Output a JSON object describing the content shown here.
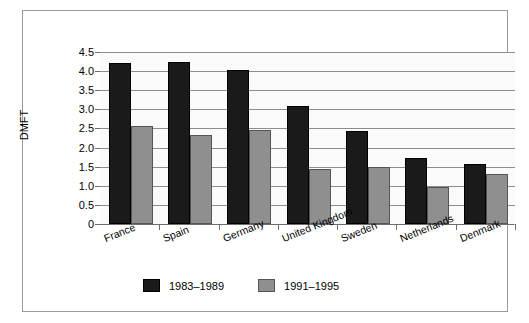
{
  "chart_data": {
    "type": "bar",
    "title": "",
    "xlabel": "",
    "ylabel": "DMFT",
    "ylim": [
      0,
      4.5
    ],
    "yticks": [
      "0",
      "0.5",
      "1.0",
      "1.5",
      "2.0",
      "2.5",
      "3.0",
      "3.5",
      "4.0",
      "4.5"
    ],
    "ytick_values": [
      0,
      0.5,
      1.0,
      1.5,
      2.0,
      2.5,
      3.0,
      3.5,
      4.0,
      4.5
    ],
    "grid": true,
    "legend_position": "bottom",
    "categories": [
      "France",
      "Spain",
      "Germany",
      "United Kingdom",
      "Sweden",
      "Netherlands",
      "Denmark"
    ],
    "series": [
      {
        "name": "1983–1989",
        "color": "#1a1a1a",
        "values": [
          4.22,
          4.24,
          4.02,
          3.1,
          2.44,
          1.72,
          1.58
        ]
      },
      {
        "name": "1991–1995",
        "color": "#8f8f8f",
        "values": [
          2.57,
          2.33,
          2.47,
          1.45,
          1.49,
          0.97,
          1.31
        ]
      }
    ]
  }
}
